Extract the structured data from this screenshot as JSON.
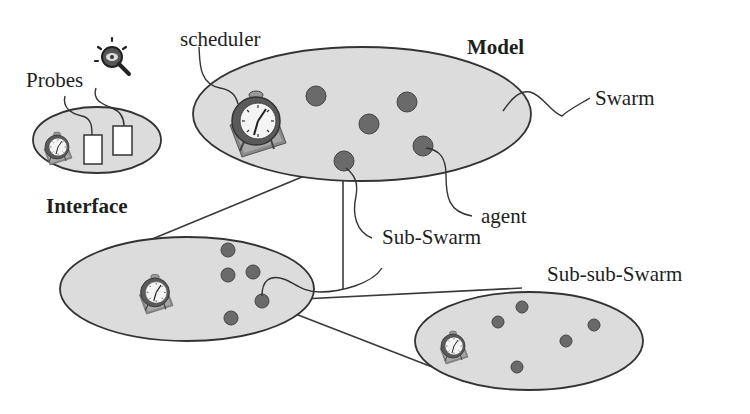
{
  "labels": {
    "probes": "Probes",
    "interface": "Interface",
    "scheduler": "scheduler",
    "model": "Model",
    "swarm": "Swarm",
    "agent": "agent",
    "sub_swarm": "Sub-Swarm",
    "sub_sub_swarm": "Sub-sub-Swarm"
  },
  "colors": {
    "ellipse_fill": "#dcdcdc",
    "ellipse_stroke": "#333333",
    "agent_fill": "#6a6a6a",
    "line": "#3a3a3a"
  },
  "diagram": {
    "nodes": [
      {
        "id": "interface",
        "label": "Interface",
        "contains": [
          "scheduler-clock",
          "probe-1",
          "probe-2"
        ]
      },
      {
        "id": "model-swarm",
        "label": "Model / Swarm",
        "contains": [
          "scheduler-clock",
          "agent x6"
        ]
      },
      {
        "id": "sub-swarm",
        "label": "Sub-Swarm",
        "contains": [
          "scheduler-clock",
          "agent x5"
        ]
      },
      {
        "id": "sub-sub-swarm",
        "label": "Sub-sub-Swarm",
        "contains": [
          "scheduler-clock",
          "agent x5"
        ]
      }
    ],
    "edges": [
      {
        "from": "model-swarm agent",
        "to": "sub-swarm",
        "type": "zoom-expansion"
      },
      {
        "from": "sub-swarm agent",
        "to": "sub-sub-swarm",
        "type": "zoom-expansion"
      }
    ]
  }
}
